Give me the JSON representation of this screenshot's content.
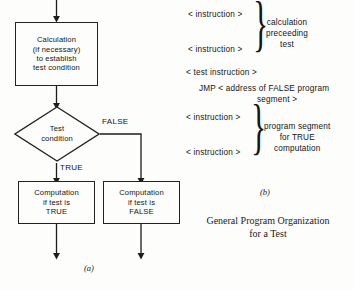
{
  "figure": {
    "caption_lines": [
      "General Program Organization",
      "for a Test"
    ],
    "part_a_label": "(a)",
    "part_b_label": "(b)"
  },
  "flowchart": {
    "calculation_box": {
      "lines": [
        "Calculation",
        "(if necessary)",
        "to establish",
        "test condition"
      ]
    },
    "decision": {
      "lines": [
        "Test",
        "condition"
      ]
    },
    "branch_labels": {
      "true": "TRUE",
      "false": "FALSE"
    },
    "true_box": {
      "lines": [
        "Computation",
        "if test is",
        "TRUE"
      ]
    },
    "false_box": {
      "lines": [
        "Computation",
        "if test is",
        "FALSE"
      ]
    }
  },
  "listing": {
    "lines": [
      "< instruction >",
      "< instruction >",
      "< test instruction >",
      "JMP < address of FALSE program",
      "segment >",
      "< instruction >",
      "< instruction >"
    ],
    "group_one_note": [
      "calculation",
      "preceeding",
      "test"
    ],
    "group_two_note": [
      "program segment",
      "for TRUE",
      "computation"
    ],
    "brace_glyph": "}"
  },
  "artifact": {
    "bleed_text": "scanned page bleed"
  },
  "colors": {
    "ink": "#141414",
    "stroke": "#222222",
    "paper": "#fdfdfb"
  }
}
